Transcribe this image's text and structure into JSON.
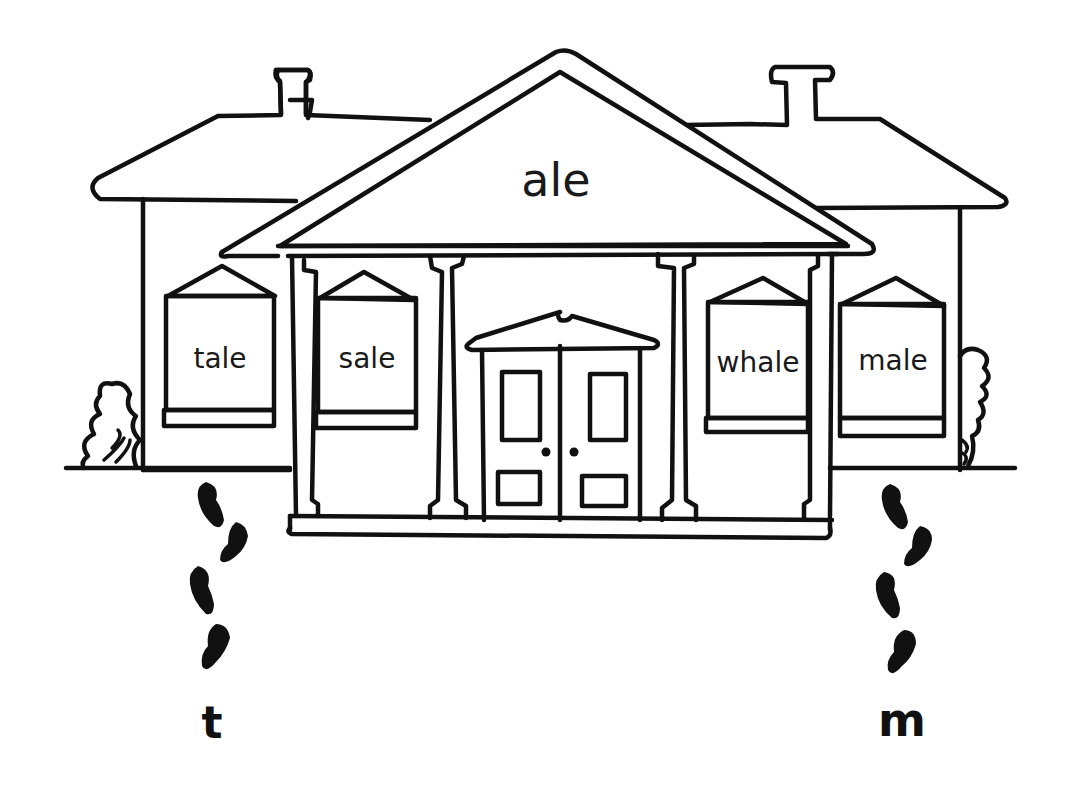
{
  "illustration": {
    "subject": "word family house",
    "word_family": "ale",
    "windows": [
      {
        "label": "tale"
      },
      {
        "label": "sale"
      },
      {
        "label": "whale"
      },
      {
        "label": "male"
      }
    ],
    "footprint_trails": [
      {
        "side": "left",
        "letter": "t"
      },
      {
        "side": "right",
        "letter": "m"
      }
    ],
    "colors": {
      "ink": "#111111",
      "background": "#ffffff"
    }
  }
}
